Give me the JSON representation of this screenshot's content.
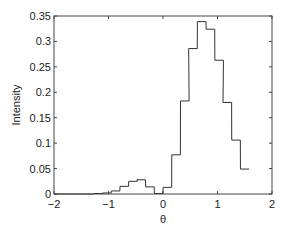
{
  "chart_data": {
    "type": "bar",
    "style": "stairs-histogram",
    "title": "",
    "xlabel": "θ",
    "ylabel": "Intensity",
    "xlim": [
      -2,
      2
    ],
    "ylim": [
      0,
      0.35
    ],
    "xticks": [
      -2,
      -1,
      0,
      1,
      2
    ],
    "xtick_labels": [
      "−2",
      "−1",
      "0",
      "1",
      "2"
    ],
    "yticks": [
      0,
      0.05,
      0.1,
      0.15,
      0.2,
      0.25,
      0.3,
      0.35
    ],
    "ytick_labels": [
      "0",
      "0.05",
      "0.1",
      "0.15",
      "0.2",
      "0.25",
      "0.3",
      "0.35"
    ],
    "grid": false,
    "legend": null,
    "bin_width": 0.158,
    "bin_centers": [
      -1.5,
      -1.34,
      -1.18,
      -1.03,
      -0.87,
      -0.71,
      -0.55,
      -0.4,
      -0.24,
      -0.08,
      0.08,
      0.24,
      0.4,
      0.55,
      0.71,
      0.87,
      1.03,
      1.18,
      1.34,
      1.5
    ],
    "values": [
      0.0,
      0.0,
      0.001,
      0.002,
      0.006,
      0.015,
      0.025,
      0.028,
      0.014,
      0.001,
      0.013,
      0.077,
      0.183,
      0.286,
      0.339,
      0.324,
      0.263,
      0.18,
      0.106,
      0.049
    ],
    "line_color": "#333333"
  }
}
